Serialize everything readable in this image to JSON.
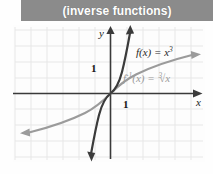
{
  "header": {
    "title": "(inverse functions)",
    "background_color": "#8b8b8b",
    "text_color": "#ffffff"
  },
  "figure": {
    "axes": {
      "x_axis_label": "x",
      "y_axis_label": "y",
      "x_tick_label": "1",
      "y_tick_label": "1",
      "grid": true,
      "grid_color": "#e6e6e6",
      "axis_color": "#3a3a3a",
      "xlim": [
        -6,
        6
      ],
      "ylim": [
        -4.5,
        4
      ]
    },
    "curves": [
      {
        "name": "cubic",
        "label_text": "f(x) = x",
        "label_exponent": "3",
        "expression": "f(x) = x^3",
        "color": "#3b3b3b",
        "style": "solid",
        "arrows": "both"
      },
      {
        "name": "cube-root",
        "label_prefix": "f",
        "label_exponent": "-1",
        "label_text": "(x) = ",
        "label_radical": "√x",
        "label_index": "3",
        "expression": "f^-1(x) = cbrt(x)",
        "color": "#9a9a9a",
        "style": "solid",
        "arrows": "both"
      }
    ]
  }
}
